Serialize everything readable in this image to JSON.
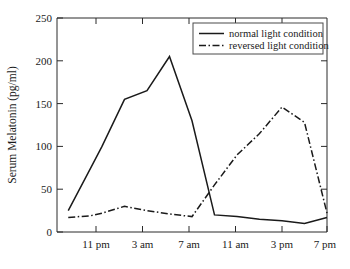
{
  "chart_data": {
    "type": "line",
    "title": "",
    "xlabel": "",
    "ylabel": "Serum Melatonin (pg/ml)",
    "ylim": [
      0,
      250
    ],
    "yticks": [
      0,
      50,
      100,
      150,
      200,
      250
    ],
    "ytick_labels": [
      "0",
      "50",
      "100",
      "150",
      "200",
      "250"
    ],
    "xlim": [
      19,
      43
    ],
    "xticks": [
      23,
      27,
      31,
      35,
      39,
      43
    ],
    "xtick_labels": [
      "11 pm",
      "3 am",
      "7 am",
      "11 am",
      "3 pm",
      "7 pm"
    ],
    "grid": false,
    "legend_position": "top-right",
    "x": [
      20,
      22,
      23,
      25,
      27,
      29,
      31,
      33,
      35,
      37,
      39,
      41,
      43
    ],
    "x_clock_labels": [
      "8 pm",
      "10 pm",
      "11 pm",
      "1 am",
      "3 am",
      "5 am",
      "7 am",
      "9 am",
      "11 am",
      "1 pm",
      "3 pm",
      "5 pm",
      "7 pm"
    ],
    "series": [
      {
        "name": "normal light condition",
        "style": "solid",
        "color": "#1a1a1a",
        "values": [
          25,
          75,
          100,
          155,
          165,
          205,
          130,
          20,
          18,
          15,
          13,
          10,
          17
        ]
      },
      {
        "name": "reversed light condition",
        "style": "dash-dot",
        "color": "#1a1a1a",
        "values": [
          17,
          19,
          22,
          30,
          25,
          21,
          18,
          55,
          90,
          115,
          146,
          128,
          22
        ]
      }
    ]
  },
  "axes": {
    "y_axis_label": "Serum Melatonin (pg/ml)",
    "y_tick_labels": [
      "250",
      "200",
      "150",
      "100",
      "50",
      "0"
    ],
    "x_tick_labels": [
      "11 pm",
      "3 am",
      "7 am",
      "11 am",
      "3 pm",
      "7 pm"
    ]
  },
  "legend": {
    "entries": [
      {
        "label": "normal light condition",
        "style": "solid"
      },
      {
        "label": "reversed light condition",
        "style": "dash-dot"
      }
    ]
  }
}
